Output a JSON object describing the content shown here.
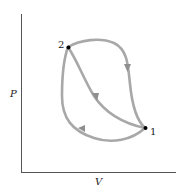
{
  "diagram": {
    "type": "pressure-volume diagram",
    "axes": {
      "y_label": "P",
      "x_label": "V"
    },
    "points": [
      {
        "id": "1",
        "label": "1"
      },
      {
        "id": "2",
        "label": "2"
      }
    ],
    "paths": [
      {
        "name": "upper-path",
        "from": "2",
        "to": "1",
        "direction": "2 to 1"
      },
      {
        "name": "middle-path",
        "from": "2",
        "to": "1",
        "direction": "2 to 1"
      },
      {
        "name": "lower-path",
        "from": "1",
        "to": "2",
        "direction": "1 to 2"
      }
    ],
    "colors": {
      "axis": "#555555",
      "curve": "#a8a8a8",
      "arrow": "#8f8f8f",
      "point": "#000000"
    }
  }
}
